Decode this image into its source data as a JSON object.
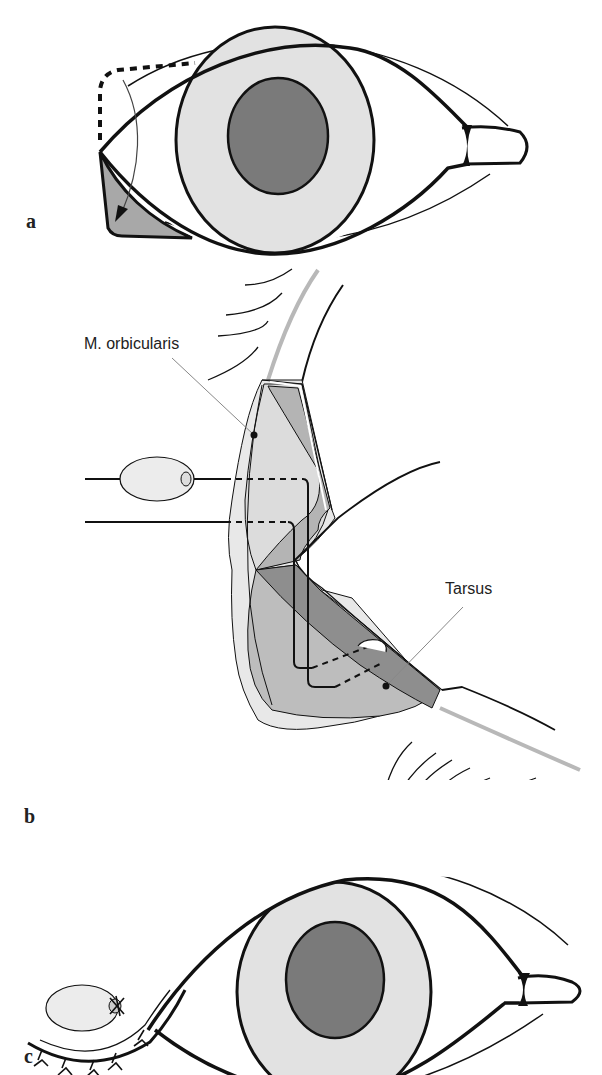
{
  "figure": {
    "panels": [
      {
        "id": "a",
        "label": "a",
        "description": "Frontal eye view with dashed incision outline and arrow indicating flap rotation to lower lateral canthus (shaded triangle)"
      },
      {
        "id": "b",
        "label": "b",
        "description": "Cross-section of eyelid with suture passed through M. orbicularis and Tarsus, tied over bolster",
        "annotations": [
          {
            "label": "M. orbicularis"
          },
          {
            "label": "Tarsus"
          }
        ]
      },
      {
        "id": "c",
        "label": "c",
        "description": "Frontal eye view after closure with bolster tied at lateral canthus and interrupted sutures"
      }
    ]
  },
  "colors": {
    "line": "#111111",
    "iris": "#e2e2e2",
    "pupil": "#7a7a7a",
    "flap": "#a8a8a8",
    "tissue_light": "#dcdcdc",
    "tissue_mid": "#b4b4b4",
    "tissue_dark": "#8e8e8e",
    "gray_line": "#b8b8b8",
    "bolster": "#ececec"
  }
}
